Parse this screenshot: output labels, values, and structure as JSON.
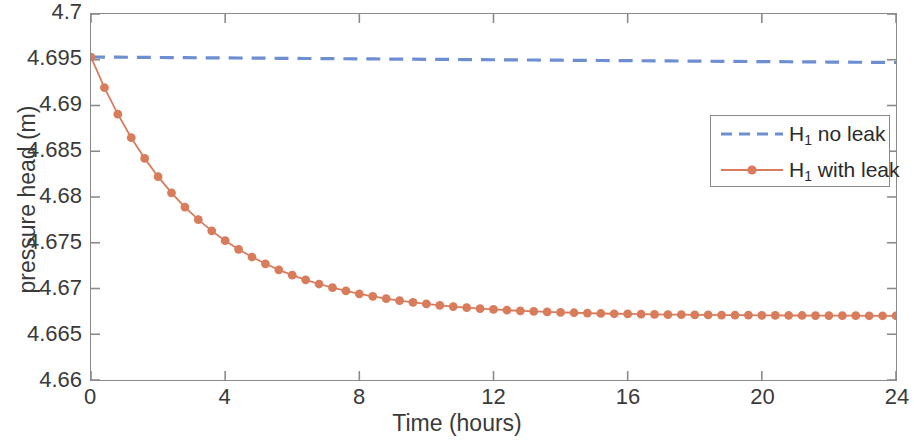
{
  "chart_data": {
    "type": "line",
    "title": "",
    "xlabel": "Time (hours)",
    "ylabel": "pressure head (m)",
    "xlim": [
      0,
      24
    ],
    "ylim": [
      4.66,
      4.7
    ],
    "xticks": [
      "0",
      "4",
      "8",
      "12",
      "16",
      "20",
      "24"
    ],
    "xtick_values": [
      0,
      4,
      8,
      12,
      16,
      20,
      24
    ],
    "yticks": [
      "4.66",
      "4.665",
      "4.67",
      "4.675",
      "4.68",
      "4.685",
      "4.69",
      "4.695",
      "4.7"
    ],
    "ytick_values": [
      4.66,
      4.665,
      4.67,
      4.675,
      4.68,
      4.685,
      4.69,
      4.695,
      4.7
    ],
    "grid": false,
    "legend_position": "right",
    "colors": {
      "no_leak": "#6d8fd2",
      "with_leak": "#d87c5b",
      "axis": "#8a8a8a",
      "text": "#3a3a3a"
    },
    "x": [
      0,
      0.4,
      0.8,
      1.2,
      1.6,
      2,
      2.4,
      2.8,
      3.2,
      3.6,
      4,
      4.4,
      4.8,
      5.2,
      5.6,
      6,
      6.4,
      6.8,
      7.2,
      7.6,
      8,
      8.4,
      8.8,
      9.2,
      9.6,
      10,
      10.4,
      10.8,
      11.2,
      11.6,
      12,
      12.4,
      12.8,
      13.2,
      13.6,
      14,
      14.4,
      14.8,
      15.2,
      15.6,
      16,
      16.4,
      16.8,
      17.2,
      17.6,
      18,
      18.4,
      18.8,
      19.2,
      19.6,
      20,
      20.4,
      20.8,
      21.2,
      21.6,
      22,
      22.4,
      22.8,
      23.2,
      23.6,
      24
    ],
    "series": [
      {
        "name": "H_1 no leak",
        "label_html": "H<sub>1</sub> no leak",
        "style": "dashed",
        "marker": "none",
        "color": "#6d8fd2",
        "values": [
          4.6953,
          4.69529,
          4.69528,
          4.69527,
          4.69526,
          4.69525,
          4.69524,
          4.69523,
          4.69522,
          4.69521,
          4.6952,
          4.69519,
          4.69518,
          4.69517,
          4.69516,
          4.69515,
          4.69514,
          4.69513,
          4.69512,
          4.69511,
          4.6951,
          4.69509,
          4.69508,
          4.69507,
          4.69506,
          4.69505,
          4.69504,
          4.69503,
          4.69502,
          4.69501,
          4.695,
          4.69499,
          4.69498,
          4.69497,
          4.69496,
          4.69495,
          4.69494,
          4.69493,
          4.69492,
          4.69491,
          4.6949,
          4.69489,
          4.69488,
          4.69487,
          4.69486,
          4.69485,
          4.69484,
          4.69483,
          4.69482,
          4.69481,
          4.6948,
          4.69479,
          4.69478,
          4.69477,
          4.69476,
          4.69475,
          4.69474,
          4.69473,
          4.69472,
          4.69471,
          4.6947
        ]
      },
      {
        "name": "H_1 with leak",
        "label_html": "H<sub>1</sub> with leak",
        "style": "solid",
        "marker": "circle",
        "color": "#d87c5b",
        "values": [
          4.6953,
          4.69195,
          4.68905,
          4.68648,
          4.68422,
          4.68222,
          4.68046,
          4.6789,
          4.67752,
          4.6763,
          4.67523,
          4.67428,
          4.67344,
          4.6727,
          4.67204,
          4.67146,
          4.67095,
          4.67049,
          4.67009,
          4.66973,
          4.66942,
          4.66914,
          4.66889,
          4.66867,
          4.66848,
          4.66831,
          4.66816,
          4.66802,
          4.66791,
          4.6678,
          4.66771,
          4.66763,
          4.66756,
          4.6675,
          4.66744,
          4.66739,
          4.66735,
          4.66731,
          4.66727,
          4.66724,
          4.66722,
          4.66719,
          4.66717,
          4.66715,
          4.66714,
          4.66712,
          4.66711,
          4.6671,
          4.66709,
          4.66708,
          4.66707,
          4.66706,
          4.66705,
          4.66705,
          4.66704,
          4.66704,
          4.66703,
          4.66703,
          4.66702,
          4.66702,
          4.66702
        ]
      }
    ]
  },
  "legend": {
    "items": [
      {
        "label_text": "H",
        "sub": "1",
        "rest": " no leak"
      },
      {
        "label_text": "H",
        "sub": "1",
        "rest": " with leak"
      }
    ]
  }
}
